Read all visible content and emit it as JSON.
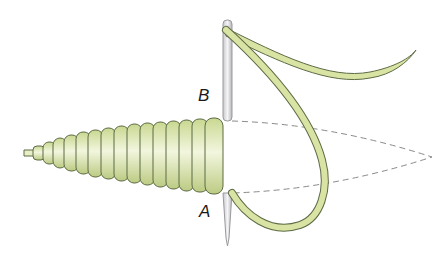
{
  "diagram": {
    "labels": [
      {
        "id": "B",
        "text": "B",
        "x": 198,
        "y": 86
      },
      {
        "id": "A",
        "text": "A",
        "x": 199,
        "y": 202
      }
    ],
    "colors": {
      "thread_fill": "#d8e3a4",
      "thread_stroke": "#5d6b45",
      "needle_fill": "#e6e6e8",
      "needle_stroke": "#9a9a9e",
      "dashed_outline": "#8a8a8a"
    },
    "coil_count": 15
  }
}
